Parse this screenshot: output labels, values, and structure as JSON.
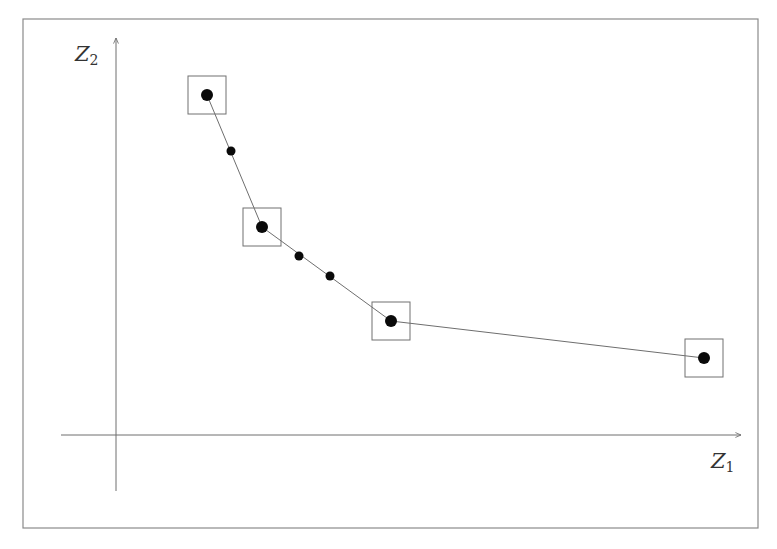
{
  "diagram": {
    "colors": {
      "background": "#ffffff",
      "frame": "#8a8a8a",
      "axis": "#6e6e6e",
      "line": "#6e6e6e",
      "box": "#707070",
      "point": "#0a0a0a",
      "label": "#333333"
    },
    "frame": {
      "x1": 23,
      "y1": 19,
      "x2": 758,
      "y2": 528
    },
    "x_axis": {
      "label_main": "Z",
      "label_sub": "1",
      "from": [
        61,
        435
      ],
      "to": [
        741,
        435
      ]
    },
    "y_axis": {
      "label_main": "Z",
      "label_sub": "2",
      "from": [
        116,
        491
      ],
      "to": [
        116,
        38
      ]
    },
    "boxed_points": [
      {
        "id": "A",
        "cx": 207,
        "cy": 95
      },
      {
        "id": "B",
        "cx": 262,
        "cy": 227
      },
      {
        "id": "C",
        "cx": 391,
        "cy": 321
      },
      {
        "id": "D",
        "cx": 704,
        "cy": 358
      }
    ],
    "intermediate_points": [
      {
        "cx": 231,
        "cy": 151,
        "segment": "A-B"
      },
      {
        "cx": 299,
        "cy": 256,
        "segment": "B-C"
      },
      {
        "cx": 330,
        "cy": 276,
        "segment": "B-C"
      }
    ],
    "box_half_size": 19,
    "large_point_radius": 6,
    "small_point_radius": 4.5
  }
}
